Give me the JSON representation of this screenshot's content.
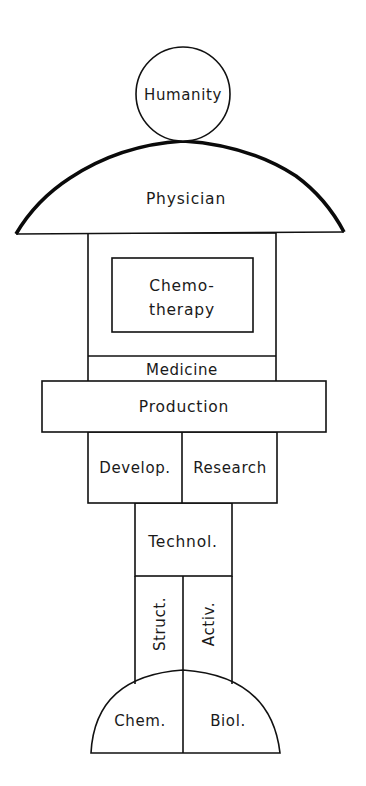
{
  "diagram": {
    "type": "structure-pillar",
    "colors": {
      "stroke": "#111111",
      "fill": "#ffffff",
      "text": "#1a1a1a"
    },
    "nodes": {
      "humanity": {
        "label": "Humanity",
        "shape": "circle"
      },
      "physician": {
        "label": "Physician",
        "shape": "dome"
      },
      "chemotherapy": {
        "label_line1": "Chemo-",
        "label_line2": "therapy",
        "shape": "rectangle"
      },
      "medicine": {
        "label": "Medicine",
        "shape": "band"
      },
      "production": {
        "label": "Production",
        "shape": "wide-rectangle"
      },
      "development": {
        "label": "Develop.",
        "shape": "rectangle"
      },
      "research": {
        "label": "Research",
        "shape": "rectangle"
      },
      "technology": {
        "label": "Technol.",
        "shape": "rectangle"
      },
      "structure": {
        "label": "Struct.",
        "shape": "column",
        "text_rotation": "vertical"
      },
      "activity": {
        "label": "Activ.",
        "shape": "column",
        "text_rotation": "vertical"
      },
      "chemistry": {
        "label": "Chem.",
        "shape": "half-dome"
      },
      "biology": {
        "label": "Biol.",
        "shape": "half-dome"
      }
    },
    "layers_top_to_bottom": [
      [
        "Humanity"
      ],
      [
        "Physician"
      ],
      [
        "Chemo-therapy"
      ],
      [
        "Medicine"
      ],
      [
        "Production"
      ],
      [
        "Develop.",
        "Research"
      ],
      [
        "Technol."
      ],
      [
        "Struct.",
        "Activ."
      ],
      [
        "Chem.",
        "Biol."
      ]
    ]
  }
}
